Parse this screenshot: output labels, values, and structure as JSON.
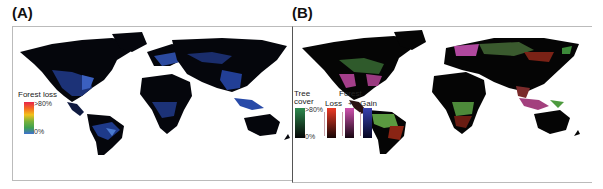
{
  "panels": [
    {
      "label": "(A)",
      "legend": {
        "title": "Forest loss",
        "max_label": ">80%",
        "min_label": "0%",
        "gradient": [
          "#e8254b",
          "#f36a21",
          "#f2c21a",
          "#7ab23a",
          "#3fa14f",
          "#3f6fcf"
        ]
      },
      "map_colors": {
        "land": "#05060c",
        "accent": "#3b5fb8",
        "water": "#ffffff"
      }
    },
    {
      "label": "(B)",
      "legend": {
        "tree_cover_title": "Tree cover",
        "tree_cover_max": ">80%",
        "tree_cover_min": "0%",
        "forest_title": "Forest",
        "loss_label": "Loss",
        "plus_label": "+",
        "gain_label": "Gain",
        "tree_cover_colors": [
          "#2e8a4e",
          "#050505"
        ],
        "loss_colors": [
          "#ee3a25",
          "#150505"
        ],
        "both_colors": [
          "#d153b0",
          "#150510"
        ],
        "gain_colors": [
          "#3a42b0",
          "#050520"
        ]
      },
      "map_colors": {
        "land": "#050505",
        "green": "#4d9a3e",
        "red": "#a02818",
        "magenta": "#b0488e"
      }
    }
  ]
}
